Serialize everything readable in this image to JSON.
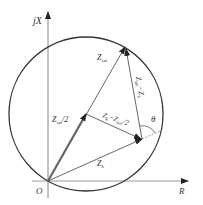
{
  "diagram": {
    "axes": {
      "y_label": "jX",
      "x_label": "R",
      "origin_label": "O"
    },
    "vectors": [
      {
        "id": "zset",
        "label": "Z",
        "sub": "set"
      },
      {
        "id": "zset_half",
        "label": "Z",
        "sub": "set",
        "suffix": "/2"
      },
      {
        "id": "zk",
        "label": "Z",
        "sub": "k"
      },
      {
        "id": "zk_minus_half",
        "label": "Z",
        "sub": "k",
        "mid": "−Z",
        "sub2": "set",
        "suffix": "/2"
      },
      {
        "id": "zset_minus_zk",
        "label": "Z",
        "sub": "set",
        "mid": "−Z",
        "sub2": "k"
      }
    ],
    "angle_label": "θ",
    "colors": {
      "line": "#333333",
      "thick_vector": "#555555",
      "axis": "#888888"
    }
  }
}
